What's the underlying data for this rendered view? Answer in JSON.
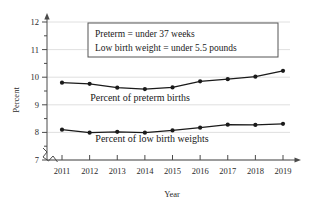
{
  "chart_data": {
    "type": "line",
    "title": "",
    "xlabel": "Year",
    "ylabel": "Percent",
    "categories": [
      "2011",
      "2012",
      "2013",
      "2014",
      "2015",
      "2016",
      "2017",
      "2018",
      "2019"
    ],
    "x": [
      2011,
      2012,
      2013,
      2014,
      2015,
      2016,
      2017,
      2018,
      2019
    ],
    "series": [
      {
        "name": "Percent of preterm births",
        "values": [
          9.8,
          9.76,
          9.62,
          9.57,
          9.63,
          9.85,
          9.93,
          10.02,
          10.23
        ]
      },
      {
        "name": "Percent of low birth weights",
        "values": [
          8.1,
          7.99,
          8.02,
          7.99,
          8.07,
          8.17,
          8.28,
          8.27,
          8.31
        ]
      }
    ],
    "ylim": [
      7,
      12
    ],
    "yticks": [
      7,
      8,
      9,
      10,
      11,
      12
    ],
    "ytick_labels": [
      "7",
      "8",
      "9",
      "10",
      "11",
      "12"
    ],
    "y_minor_step": 0.5,
    "xlim": [
      2011,
      2019
    ],
    "grid": true,
    "legend": "inline-labels",
    "axis_break": true,
    "annotations": [
      "Preterm = under 37 weeks",
      "Low birth weight = under 5.5 pounds"
    ]
  },
  "axis": {
    "y_title": "Percent",
    "x_title": "Year",
    "ticks_y": [
      "12",
      "11",
      "10",
      "9",
      "8",
      "7"
    ],
    "ticks_x": [
      "2011",
      "2012",
      "2013",
      "2014",
      "2015",
      "2016",
      "2017",
      "2018",
      "2019"
    ]
  },
  "note_box": {
    "line1": "Preterm = under 37 weeks",
    "line2": "Low birth weight = under 5.5 pounds"
  },
  "labels": {
    "preterm": "Percent of preterm births",
    "lowbirth": "Percent of low birth weights"
  },
  "colors": {
    "line": "#1a1a1a",
    "grid": "#d8d8d8",
    "axis": "#4a4a4a",
    "text": "#1a1a1a",
    "background": "#ffffff",
    "note_border": "#555555"
  }
}
